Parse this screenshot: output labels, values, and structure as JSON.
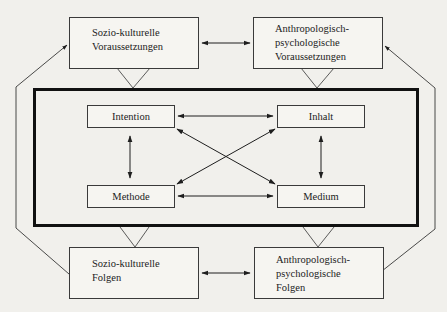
{
  "diagram": {
    "type": "flow-model",
    "outer_boxes": {
      "top_left": {
        "lines": [
          "Sozio-kulturelle",
          "Voraussetzungen"
        ]
      },
      "top_right": {
        "lines": [
          "Anthropologisch-",
          "psychologische",
          "Voraussetzungen"
        ]
      },
      "bottom_left": {
        "lines": [
          "Sozio-kulturelle",
          "Folgen"
        ]
      },
      "bottom_right": {
        "lines": [
          "Anthropologisch-",
          "psychologische",
          "Folgen"
        ]
      }
    },
    "inner_boxes": {
      "top_left": {
        "label": "Intention"
      },
      "top_right": {
        "label": "Inhalt"
      },
      "bottom_left": {
        "label": "Methode"
      },
      "bottom_right": {
        "label": "Medium"
      }
    },
    "connections": [
      {
        "from": "Sozio-kulturelle Voraussetzungen",
        "to": "Anthropologisch-psychologische Voraussetzungen",
        "type": "bidirectional"
      },
      {
        "from": "Sozio-kulturelle Folgen",
        "to": "Anthropologisch-psychologische Folgen",
        "type": "bidirectional"
      },
      {
        "from": "Intention",
        "to": "Inhalt",
        "type": "bidirectional"
      },
      {
        "from": "Methode",
        "to": "Medium",
        "type": "bidirectional"
      },
      {
        "from": "Intention",
        "to": "Methode",
        "type": "bidirectional"
      },
      {
        "from": "Inhalt",
        "to": "Medium",
        "type": "bidirectional"
      },
      {
        "from": "Intention",
        "to": "Medium",
        "type": "bidirectional"
      },
      {
        "from": "Inhalt",
        "to": "Methode",
        "type": "bidirectional"
      },
      {
        "from": "Sozio-kulturelle Folgen",
        "to": "Sozio-kulturelle Voraussetzungen",
        "type": "feedback"
      },
      {
        "from": "Anthropologisch-psychologische Folgen",
        "to": "Anthropologisch-psychologische Voraussetzungen",
        "type": "feedback"
      }
    ],
    "colors": {
      "background": "#f1f0ec",
      "stroke": "#2a2a2a",
      "frame": "#111111"
    }
  }
}
